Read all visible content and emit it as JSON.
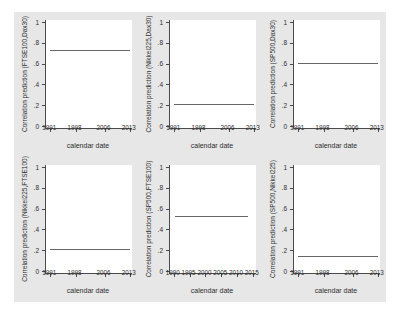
{
  "figure": {
    "background_color": "#e7e7e7",
    "plot_background_color": "#ffffff",
    "line_color": "#666666",
    "axis_color": "#4a4a4a",
    "text_color": "#2e2e2e"
  },
  "chart_data": [
    {
      "type": "line",
      "title": "",
      "ylabel": "Correlation prediction (FTSE100,Dax30)",
      "xlabel": "calendar date",
      "ylim": [
        0,
        1
      ],
      "xlim": [
        1989.8,
        2013.6
      ],
      "ytick_values": [
        0,
        0.2,
        0.4,
        0.6,
        0.8,
        1
      ],
      "ytick_labels": [
        "0",
        ".2",
        ".4",
        ".6",
        ".8",
        "1"
      ],
      "xticks": [
        1991,
        1998,
        2006,
        2013
      ],
      "grid": "off",
      "series": [
        {
          "name": "correlation-prediction",
          "x": [
            1991,
            2013.2
          ],
          "y": [
            0.73,
            0.73
          ]
        }
      ]
    },
    {
      "type": "line",
      "title": "",
      "ylabel": "Correlation prediction (Nikkei225,Dax30)",
      "xlabel": "calendar date",
      "ylim": [
        0,
        1
      ],
      "xlim": [
        1989.8,
        2013.6
      ],
      "ytick_values": [
        0,
        0.2,
        0.4,
        0.6,
        0.8,
        1
      ],
      "ytick_labels": [
        "0",
        ".2",
        ".4",
        ".6",
        ".8",
        "1"
      ],
      "xticks": [
        1991,
        1998,
        2006,
        2013
      ],
      "grid": "off",
      "series": [
        {
          "name": "correlation-prediction",
          "x": [
            1991,
            2013.2
          ],
          "y": [
            0.21,
            0.21
          ]
        }
      ]
    },
    {
      "type": "line",
      "title": "",
      "ylabel": "Correlation prediction (SP500,Dax30)",
      "xlabel": "calendar date",
      "ylim": [
        0,
        1
      ],
      "xlim": [
        1989.8,
        2013.6
      ],
      "ytick_values": [
        0,
        0.2,
        0.4,
        0.6,
        0.8,
        1
      ],
      "ytick_labels": [
        "0",
        ".2",
        ".4",
        ".6",
        ".8",
        "1"
      ],
      "xticks": [
        1991,
        1998,
        2006,
        2013
      ],
      "grid": "off",
      "series": [
        {
          "name": "correlation-prediction",
          "x": [
            1991,
            2013.2
          ],
          "y": [
            0.61,
            0.61
          ]
        }
      ]
    },
    {
      "type": "line",
      "title": "",
      "ylabel": "Correlation prediction (Nikkei225,FTSE100)",
      "xlabel": "calendar date",
      "ylim": [
        0,
        1
      ],
      "xlim": [
        1989.8,
        2013.6
      ],
      "ytick_values": [
        0,
        0.2,
        0.4,
        0.6,
        0.8,
        1
      ],
      "ytick_labels": [
        "0",
        ".2",
        ".4",
        ".6",
        ".8",
        "1"
      ],
      "xticks": [
        1991,
        1998,
        2006,
        2013
      ],
      "grid": "off",
      "series": [
        {
          "name": "correlation-prediction",
          "x": [
            1991,
            2013.2
          ],
          "y": [
            0.21,
            0.21
          ]
        }
      ]
    },
    {
      "type": "line",
      "title": "",
      "ylabel": "Correlation prediction (SP500,FTSE100)",
      "xlabel": "calendar date",
      "ylim": [
        0,
        1
      ],
      "xlim": [
        1988.8,
        2016.0
      ],
      "ytick_values": [
        0,
        0.2,
        0.4,
        0.6,
        0.8,
        1
      ],
      "ytick_labels": [
        "0",
        ".2",
        ".4",
        ".6",
        ".8",
        "1"
      ],
      "xticks": [
        1990,
        1995,
        2000,
        2005,
        2010,
        2015
      ],
      "grid": "off",
      "series": [
        {
          "name": "correlation-prediction",
          "x": [
            1990.3,
            2013.5
          ],
          "y": [
            0.53,
            0.53
          ]
        }
      ]
    },
    {
      "type": "line",
      "title": "",
      "ylabel": "Correlation prediction (SP500,Nikkei225)",
      "xlabel": "calendar date",
      "ylim": [
        0,
        1
      ],
      "xlim": [
        1989.8,
        2013.6
      ],
      "ytick_values": [
        0,
        0.2,
        0.4,
        0.6,
        0.8,
        1
      ],
      "ytick_labels": [
        "0",
        ".2",
        ".4",
        ".6",
        ".8",
        "1"
      ],
      "xticks": [
        1991,
        1998,
        2006,
        2013
      ],
      "grid": "off",
      "series": [
        {
          "name": "correlation-prediction",
          "x": [
            1991,
            2013.2
          ],
          "y": [
            0.14,
            0.14
          ]
        }
      ]
    }
  ]
}
